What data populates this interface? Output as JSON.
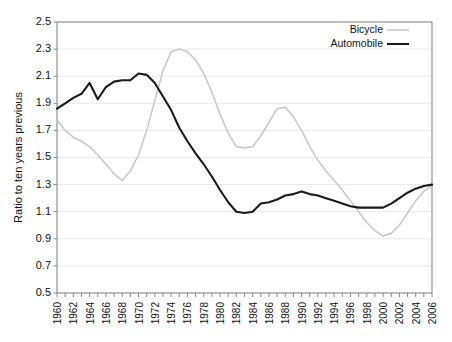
{
  "chart_data": {
    "type": "line",
    "title": "",
    "xlabel": "",
    "ylabel": "Ratio to ten years previous",
    "ylim": [
      0.5,
      2.5
    ],
    "ytick_step": 0.2,
    "yticks": [
      "2.5",
      "2.3",
      "2.1",
      "1.9",
      "1.7",
      "1.5",
      "1.3",
      "1.1",
      "0.9",
      "0.7",
      "0.5"
    ],
    "xlim": [
      1960,
      2006
    ],
    "xticks": [
      "1960",
      "1962",
      "1964",
      "1966",
      "1968",
      "1970",
      "1972",
      "1974",
      "1976",
      "1978",
      "1980",
      "1982",
      "1984",
      "1986",
      "1988",
      "1990",
      "1992",
      "1994",
      "1996",
      "1998",
      "2000",
      "2002",
      "2004",
      "2006"
    ],
    "xtick_step": 2,
    "grid": "horizontal",
    "legend_position": "top-right",
    "x": [
      1960,
      1961,
      1962,
      1963,
      1964,
      1965,
      1966,
      1967,
      1968,
      1969,
      1970,
      1971,
      1972,
      1973,
      1974,
      1975,
      1976,
      1977,
      1978,
      1979,
      1980,
      1981,
      1982,
      1983,
      1984,
      1985,
      1986,
      1987,
      1988,
      1989,
      1990,
      1991,
      1992,
      1993,
      1994,
      1995,
      1996,
      1997,
      1998,
      1999,
      2000,
      2001,
      2002,
      2003,
      2004,
      2005,
      2006
    ],
    "series": [
      {
        "name": "Bicycle",
        "color": "#c9c9c9",
        "values": [
          1.78,
          1.7,
          1.65,
          1.62,
          1.58,
          1.52,
          1.45,
          1.38,
          1.33,
          1.4,
          1.52,
          1.7,
          1.92,
          2.14,
          2.28,
          2.3,
          2.28,
          2.22,
          2.12,
          1.98,
          1.82,
          1.68,
          1.58,
          1.57,
          1.58,
          1.66,
          1.76,
          1.86,
          1.87,
          1.8,
          1.7,
          1.58,
          1.48,
          1.4,
          1.33,
          1.26,
          1.18,
          1.1,
          1.02,
          0.96,
          0.92,
          0.94,
          1.0,
          1.09,
          1.18,
          1.25,
          1.29
        ]
      },
      {
        "name": "Automobile",
        "color": "#1a1a1a",
        "values": [
          1.86,
          1.9,
          1.94,
          1.97,
          2.05,
          1.93,
          2.02,
          2.06,
          2.07,
          2.07,
          2.12,
          2.11,
          2.05,
          1.95,
          1.85,
          1.72,
          1.62,
          1.53,
          1.45,
          1.36,
          1.26,
          1.17,
          1.1,
          1.09,
          1.1,
          1.16,
          1.17,
          1.19,
          1.22,
          1.23,
          1.25,
          1.23,
          1.22,
          1.2,
          1.18,
          1.16,
          1.14,
          1.13,
          1.13,
          1.13,
          1.13,
          1.16,
          1.2,
          1.24,
          1.27,
          1.29,
          1.3
        ]
      }
    ]
  },
  "legend": {
    "items": [
      {
        "label": "Bicycle"
      },
      {
        "label": "Automobile"
      }
    ]
  }
}
